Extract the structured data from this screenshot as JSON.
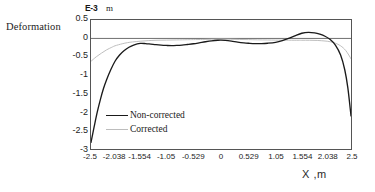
{
  "axes": {
    "y_title": "Deformation",
    "y_exponent_label": "E-3",
    "y_unit": "m",
    "x_title": "X ,m"
  },
  "legend": {
    "items": [
      {
        "label": "Non-corrected",
        "color": "#1a1a1a",
        "style": "solid"
      },
      {
        "label": "Corrected",
        "color": "#bdbdbd",
        "style": "solid"
      }
    ]
  },
  "chart_data": {
    "type": "line",
    "title": "",
    "subtitle": "",
    "xlabel": "X ,m",
    "ylabel": "Deformation",
    "y_unit": "m",
    "y_scale_label": "E-3",
    "xlim": [
      -2.5,
      2.5
    ],
    "ylim": [
      -3,
      0.5
    ],
    "grid": false,
    "legend_position": "inside-left",
    "xticks": [
      -2.5,
      -2.038,
      -1.554,
      -1.05,
      -0.529,
      0,
      0.529,
      1.05,
      1.554,
      2.038,
      2.5
    ],
    "xticklabels": [
      "-2.5",
      "-2.038",
      "-1.554",
      "-1.05",
      "-0.529",
      "0",
      "0.529",
      "1.05",
      "1.554",
      "2.038",
      "2.5"
    ],
    "yticks": [
      0.5,
      0,
      -0.5,
      -1,
      -1.5,
      -2,
      -2.5,
      -3
    ],
    "yticklabels": [
      "0.5",
      "0",
      "-0.5",
      "-1",
      "-1.5",
      "-2",
      "-2.5",
      "-3"
    ],
    "zero_line": 0,
    "series": [
      {
        "name": "Non-corrected",
        "color": "#1a1a1a",
        "x": [
          -2.5,
          -2.44,
          -2.38,
          -2.32,
          -2.26,
          -2.2,
          -2.12,
          -2.038,
          -1.95,
          -1.86,
          -1.77,
          -1.68,
          -1.554,
          -1.45,
          -1.35,
          -1.25,
          -1.15,
          -1.05,
          -0.95,
          -0.85,
          -0.75,
          -0.65,
          -0.529,
          -0.42,
          -0.3,
          -0.18,
          -0.06,
          0,
          0.08,
          0.2,
          0.32,
          0.44,
          0.529,
          0.65,
          0.78,
          0.9,
          1.05,
          1.18,
          1.3,
          1.42,
          1.554,
          1.68,
          1.8,
          1.9,
          2.0,
          2.1,
          2.2,
          2.3,
          2.38,
          2.44,
          2.5
        ],
        "y": [
          -2.82,
          -2.4,
          -2.0,
          -1.66,
          -1.36,
          -1.12,
          -0.85,
          -0.62,
          -0.45,
          -0.33,
          -0.24,
          -0.18,
          -0.135,
          -0.14,
          -0.155,
          -0.17,
          -0.182,
          -0.19,
          -0.195,
          -0.19,
          -0.18,
          -0.165,
          -0.145,
          -0.12,
          -0.09,
          -0.065,
          -0.05,
          -0.048,
          -0.055,
          -0.075,
          -0.1,
          -0.12,
          -0.13,
          -0.14,
          -0.14,
          -0.13,
          -0.105,
          -0.06,
          0.0,
          0.07,
          0.14,
          0.165,
          0.15,
          0.115,
          0.06,
          -0.03,
          -0.18,
          -0.45,
          -0.85,
          -1.35,
          -2.1
        ]
      },
      {
        "name": "Corrected",
        "color": "#bdbdbd",
        "x": [
          -2.5,
          -2.4,
          -2.3,
          -2.2,
          -2.1,
          -2.038,
          -1.9,
          -1.8,
          -1.7,
          -1.554,
          -1.4,
          -1.25,
          -1.05,
          -0.85,
          -0.65,
          -0.529,
          -0.35,
          -0.18,
          0,
          0.18,
          0.35,
          0.529,
          0.7,
          0.9,
          1.05,
          1.25,
          1.45,
          1.554,
          1.7,
          1.85,
          2.0,
          2.1,
          2.2,
          2.3,
          2.4,
          2.5
        ],
        "y": [
          -0.62,
          -0.5,
          -0.4,
          -0.31,
          -0.24,
          -0.2,
          -0.145,
          -0.115,
          -0.095,
          -0.075,
          -0.06,
          -0.05,
          -0.045,
          -0.04,
          -0.035,
          -0.032,
          -0.028,
          -0.022,
          -0.018,
          -0.022,
          -0.028,
          -0.032,
          -0.038,
          -0.042,
          -0.045,
          -0.048,
          -0.05,
          -0.05,
          -0.05,
          -0.055,
          -0.07,
          -0.09,
          -0.13,
          -0.2,
          -0.33,
          -0.55
        ]
      }
    ]
  }
}
